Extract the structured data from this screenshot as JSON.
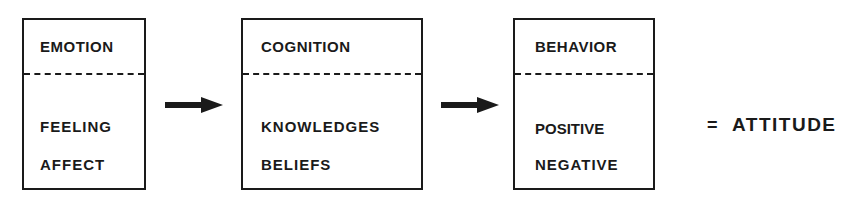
{
  "diagram": {
    "boxes": [
      {
        "title": "EMOTION",
        "items": [
          "FEELING",
          "AFFECT"
        ]
      },
      {
        "title": "COGNITION",
        "items": [
          "KNOWLEDGES",
          "BELIEFS"
        ]
      },
      {
        "title": "BEHAVIOR",
        "items": [
          "POSITIVE",
          "NEGATIVE"
        ]
      }
    ],
    "arrows": [
      "emotion-to-cognition",
      "cognition-to-behavior"
    ],
    "equals": "=",
    "result": "ATTITUDE"
  }
}
